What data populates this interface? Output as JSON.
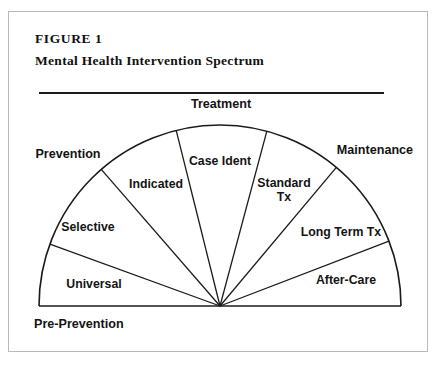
{
  "figure": {
    "label": "FIGURE 1",
    "title": "Mental Health Intervention Spectrum"
  },
  "diagram": {
    "type": "fan-semicircle",
    "center": {
      "x": 219,
      "y": 305
    },
    "radius": 181,
    "outer_labels": [
      {
        "key": "prevention",
        "text": "Prevention",
        "x": 67,
        "y": 157,
        "anchor": "middle"
      },
      {
        "key": "treatment",
        "text": "Treatment",
        "x": 220,
        "y": 107,
        "anchor": "middle"
      },
      {
        "key": "maintenance",
        "text": "Maintenance",
        "x": 374,
        "y": 153,
        "anchor": "middle"
      },
      {
        "key": "pre_prevention",
        "text": "Pre-Prevention",
        "x": 33,
        "y": 327,
        "anchor": "start"
      }
    ],
    "segments": [
      {
        "key": "universal",
        "text": "Universal",
        "start_angle": 180,
        "end_angle": 160,
        "label_x": 93,
        "label_y": 287
      },
      {
        "key": "selective",
        "text": "Selective",
        "start_angle": 160,
        "end_angle": 131,
        "label_x": 87,
        "label_y": 230
      },
      {
        "key": "indicated",
        "text": "Indicated",
        "start_angle": 131,
        "end_angle": 104,
        "label_x": 155,
        "label_y": 187
      },
      {
        "key": "case_ident",
        "text": "Case Ident",
        "start_angle": 104,
        "end_angle": 75,
        "label_x": 219,
        "label_y": 164
      },
      {
        "key": "standard_tx",
        "text": "Standard Tx",
        "line1": "Standard",
        "line2": "Tx",
        "start_angle": 75,
        "end_angle": 50,
        "label_x": 283,
        "label_y": 186
      },
      {
        "key": "long_term_tx",
        "text": "Long Term Tx",
        "start_angle": 50,
        "end_angle": 21,
        "label_x": 340,
        "label_y": 235
      },
      {
        "key": "after_care",
        "text": "After-Care",
        "start_angle": 21,
        "end_angle": 0,
        "label_x": 345,
        "label_y": 283
      }
    ]
  }
}
